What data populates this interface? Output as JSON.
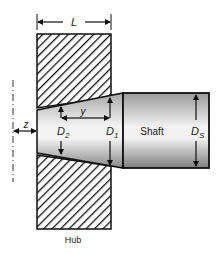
{
  "diagram": {
    "type": "tapered shaft-hub press fit",
    "labels": {
      "length": "L",
      "offset": "z",
      "axial_position": "y",
      "small_diameter": "D",
      "small_diameter_sub": "2",
      "large_diameter": "D",
      "large_diameter_sub": "1",
      "shaft_diameter": "D",
      "shaft_diameter_sub": "S",
      "shaft": "Shaft",
      "hub": "Hub"
    },
    "colors": {
      "line": "#111111",
      "hatch": "#111111",
      "shaft_light": "#f4f4f4",
      "shaft_dark": "#8a8a8a"
    }
  }
}
